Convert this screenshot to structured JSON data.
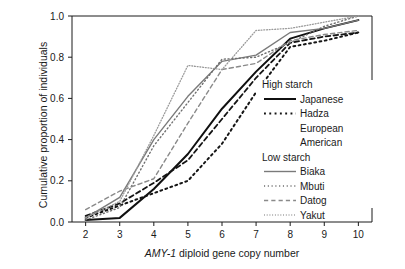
{
  "chart_data": {
    "type": "line",
    "title": "",
    "xlabel": "AMY-1 diploid gene copy number",
    "xlabel_italic_part": "AMY-1",
    "xlabel_rest": " diploid gene copy number",
    "ylabel": "Cumulative proportion of individuals",
    "xlim": [
      1.6,
      10.4
    ],
    "ylim": [
      0.0,
      1.0
    ],
    "xticks": [
      2,
      3,
      4,
      5,
      6,
      7,
      8,
      9,
      10
    ],
    "xtick_labels": [
      "2",
      "3",
      "4",
      "5",
      "6",
      "7",
      "8",
      "9",
      "10"
    ],
    "yticks": [
      0.0,
      0.2,
      0.4,
      0.6,
      0.8,
      1.0
    ],
    "ytick_labels": [
      "0.0",
      "0.2",
      "0.4",
      "0.6",
      "0.8",
      "1.0"
    ],
    "grid": false,
    "legend_position": "center-right",
    "x": [
      2,
      3,
      4,
      5,
      6,
      7,
      8,
      9,
      10
    ],
    "series": [
      {
        "name": "Japanese",
        "group": "High starch",
        "style": "solid",
        "color": "#101010",
        "width": 2.0,
        "values": [
          0.01,
          0.02,
          0.16,
          0.33,
          0.55,
          0.73,
          0.89,
          0.94,
          0.98
        ]
      },
      {
        "name": "Hadza",
        "group": "High starch",
        "style": "dotted-coarse",
        "color": "#151515",
        "width": 2.0,
        "values": [
          0.02,
          0.08,
          0.14,
          0.2,
          0.38,
          0.63,
          0.85,
          0.88,
          0.92
        ]
      },
      {
        "name": "European American",
        "group": "High starch",
        "style": "dashed",
        "color": "#151515",
        "width": 1.8,
        "values": [
          0.03,
          0.09,
          0.19,
          0.3,
          0.5,
          0.7,
          0.87,
          0.9,
          0.92
        ]
      },
      {
        "name": "Biaka",
        "group": "Low starch",
        "style": "solid",
        "color": "#7a7a7a",
        "width": 1.4,
        "values": [
          0.02,
          0.12,
          0.4,
          0.61,
          0.78,
          0.81,
          0.92,
          0.94,
          0.98
        ]
      },
      {
        "name": "Mbuti",
        "group": "Low starch",
        "style": "dotted-fine",
        "color": "#6e6e6e",
        "width": 1.4,
        "values": [
          0.01,
          0.07,
          0.37,
          0.58,
          0.79,
          0.8,
          0.87,
          0.95,
          1.0
        ]
      },
      {
        "name": "Datog",
        "group": "Low starch",
        "style": "dashed-gray",
        "color": "#8a8a8a",
        "width": 1.4,
        "values": [
          0.06,
          0.15,
          0.21,
          0.48,
          0.74,
          0.77,
          0.88,
          0.91,
          0.93
        ]
      },
      {
        "name": "Yakut",
        "group": "Low starch",
        "style": "dotted-veryfine",
        "color": "#9a9a9a",
        "width": 1.3,
        "values": [
          0.02,
          0.1,
          0.42,
          0.76,
          0.74,
          0.93,
          0.94,
          0.97,
          1.0
        ]
      }
    ],
    "legend": {
      "groups": [
        {
          "header": "High starch",
          "entries": [
            "Japanese",
            "Hadza",
            "European",
            "American"
          ]
        },
        {
          "header": "Low starch",
          "entries": [
            "Biaka",
            "Mbuti",
            "Datog",
            "Yakut"
          ]
        }
      ]
    }
  }
}
